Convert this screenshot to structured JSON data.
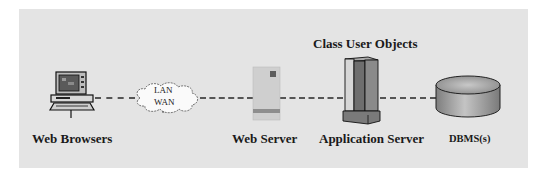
{
  "diagram": {
    "title_label": "Class User Objects",
    "nodes": [
      {
        "id": "web-browsers",
        "label": "Web Browsers",
        "icon": "desktop-computer-icon"
      },
      {
        "id": "network",
        "label_line1": "LAN",
        "label_line2": "WAN",
        "icon": "cloud-icon"
      },
      {
        "id": "web-server",
        "label": "Web Server",
        "icon": "server-box-icon"
      },
      {
        "id": "application-server",
        "label": "Application Server",
        "icon": "server-tower-icon"
      },
      {
        "id": "dbms",
        "label": "DBMS(s)",
        "icon": "database-cylinder-icon"
      }
    ],
    "connections": [
      {
        "from": "web-browsers",
        "to": "network",
        "style": "dashed"
      },
      {
        "from": "network",
        "to": "web-server",
        "style": "dashed"
      },
      {
        "from": "web-server",
        "to": "application-server",
        "style": "dashed"
      },
      {
        "from": "application-server",
        "to": "dbms",
        "style": "dashed"
      }
    ],
    "colors": {
      "background": "#e4e4e4",
      "line": "#555555",
      "text": "#1a1a1a"
    }
  }
}
